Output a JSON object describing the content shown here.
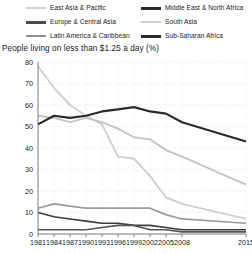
{
  "chart_data": {
    "type": "line",
    "title": "People living on less than $1.25 a day (%)",
    "xlabel": "",
    "ylabel": "",
    "ylim": [
      0,
      80
    ],
    "yticks": [
      0,
      10,
      20,
      30,
      40,
      50,
      60,
      70,
      80
    ],
    "grid": true,
    "legend_position": "top",
    "x": [
      "1981",
      "1984",
      "1987",
      "1990",
      "1993",
      "1996",
      "1999",
      "2002",
      "2005",
      "2008",
      "2015"
    ],
    "categories": [
      "1981",
      "1984",
      "1987",
      "1990",
      "1993",
      "1996",
      "1999",
      "2002",
      "2005",
      "2008",
      "2015"
    ],
    "series": [
      {
        "name": "East Asia & Pacific",
        "color": "#cfcfcf",
        "width": 1.9,
        "values": [
          78,
          68,
          60,
          55,
          51,
          36,
          35,
          27,
          17,
          14,
          7
        ]
      },
      {
        "name": "Middle East & North Africa",
        "color": "#3a3a3a",
        "width": 1.6,
        "values": [
          10,
          8,
          7,
          6,
          5,
          5,
          4,
          4,
          3,
          2,
          2
        ]
      },
      {
        "name": "Europe & Central Asia",
        "color": "#555555",
        "width": 1.6,
        "values": [
          2,
          2,
          2,
          2,
          3,
          4,
          4,
          2,
          2,
          1,
          1
        ]
      },
      {
        "name": "South Asia",
        "color": "#c4c4c4",
        "width": 1.9,
        "values": [
          55,
          54,
          52,
          54,
          52,
          49,
          45,
          44,
          39,
          36,
          23
        ]
      },
      {
        "name": "Latin America & Caribbean",
        "color": "#9b9b9b",
        "width": 1.7,
        "values": [
          12,
          14,
          13,
          12,
          12,
          12,
          12,
          12,
          9,
          7,
          5
        ]
      },
      {
        "name": "Sub-Saharan Africa",
        "color": "#2b2b2b",
        "width": 2.2,
        "values": [
          51,
          55,
          54,
          55,
          57,
          58,
          59,
          57,
          56,
          52,
          43
        ]
      }
    ]
  },
  "legend": {
    "rows": [
      {
        "left": {
          "label": "East Asia & Pacific",
          "color": "#cfcfcf",
          "thickness": 2
        },
        "right": {
          "label": "Middle East & North Africa",
          "color": "#2b2b2b",
          "thickness": 3
        }
      },
      {
        "left": {
          "label": "Europe & Central Asia",
          "color": "#4a4a4a",
          "thickness": 3
        },
        "right": {
          "label": "South Asia",
          "color": "#cfcfcf",
          "thickness": 2
        }
      },
      {
        "left": {
          "label": "Latin America & Caribbean",
          "color": "#8f8f8f",
          "thickness": 2
        },
        "right": {
          "label": "Sub-Saharan Africa",
          "color": "#2b2b2b",
          "thickness": 3
        }
      }
    ]
  },
  "axes": {
    "y_labels": [
      "80",
      "70",
      "60",
      "50",
      "40",
      "30",
      "20",
      "10",
      "0"
    ],
    "x_labels": [
      "1981",
      "1984",
      "1987",
      "1990",
      "1993",
      "1996",
      "1999",
      "2002",
      "2005",
      "2008",
      "2015"
    ]
  },
  "colors": {
    "grid": "#d8d8d8",
    "axis": "#6f6f6f",
    "text": "#1a1a1a",
    "background": "#ffffff"
  }
}
